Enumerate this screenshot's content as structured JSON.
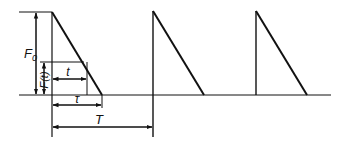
{
  "diagram": {
    "type": "periodic-triangular-pulse-load",
    "labels": {
      "peak_force": "F",
      "peak_force_subscript": "0",
      "instant_force": "F(t)",
      "time": "t",
      "pulse_duration": "τ",
      "period": "T"
    },
    "pulses": 3,
    "colors": {
      "stroke": "#111111",
      "background": "#ffffff"
    }
  }
}
